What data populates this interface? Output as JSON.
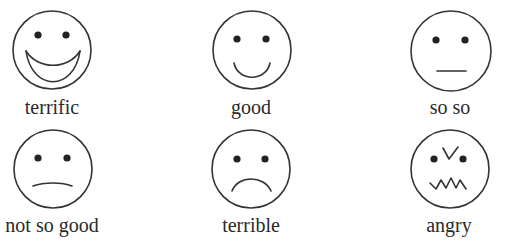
{
  "stroke_color": "#333333",
  "faces": [
    {
      "id": "terrific",
      "label": "terrific",
      "expression": "big-grin",
      "cx": 52,
      "cy": 50,
      "r": 39
    },
    {
      "id": "good",
      "label": "good",
      "expression": "smile",
      "cx": 252,
      "cy": 50,
      "r": 39
    },
    {
      "id": "so-so",
      "label": "so so",
      "expression": "neutral",
      "cx": 451,
      "cy": 51,
      "r": 40
    },
    {
      "id": "not-so-good",
      "label": "not so good",
      "expression": "slight-frown",
      "cx": 53,
      "cy": 169,
      "r": 39
    },
    {
      "id": "terrible",
      "label": "terrible",
      "expression": "frown",
      "cx": 251,
      "cy": 169,
      "r": 39
    },
    {
      "id": "angry",
      "label": "angry",
      "expression": "angry",
      "cx": 450,
      "cy": 169,
      "r": 39
    }
  ]
}
